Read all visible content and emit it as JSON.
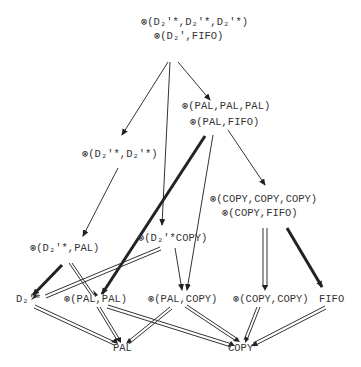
{
  "diagram": {
    "type": "lattice",
    "nodes": [
      {
        "id": "top",
        "lines": [
          "⊗(D₂'*,D₂'*,D₂'*)",
          "⊗(D₂',FIFO)"
        ]
      },
      {
        "id": "d2star_d2star",
        "lines": [
          "⊗(D₂'*,D₂'*)"
        ]
      },
      {
        "id": "pal3",
        "lines": [
          "⊗(PAL,PAL,PAL)",
          "⊗(PAL,FIFO)"
        ]
      },
      {
        "id": "copy3",
        "lines": [
          "⊗(COPY,COPY,COPY)",
          "⊗(COPY,FIFO)"
        ]
      },
      {
        "id": "d2star_pal",
        "lines": [
          "⊗(D₂'*,PAL)"
        ]
      },
      {
        "id": "d2star_copy",
        "lines": [
          "⊗(D₂'*,COPY)"
        ]
      },
      {
        "id": "d2star",
        "lines": [
          "D₂'*"
        ]
      },
      {
        "id": "pal_pal",
        "lines": [
          "⊗(PAL,PAL)"
        ]
      },
      {
        "id": "pal_copy",
        "lines": [
          "⊗(PAL,COPY)"
        ]
      },
      {
        "id": "copy_copy",
        "lines": [
          "⊗(COPY,COPY)"
        ]
      },
      {
        "id": "fifo",
        "lines": [
          "FIFO"
        ]
      },
      {
        "id": "pal",
        "lines": [
          "PAL"
        ]
      },
      {
        "id": "copy",
        "lines": [
          "COPY"
        ]
      }
    ],
    "edges": [
      {
        "from": "top",
        "to": "d2star_d2star",
        "style": "single"
      },
      {
        "from": "top",
        "to": "d2star_copy",
        "style": "single"
      },
      {
        "from": "top",
        "to": "pal3",
        "style": "single"
      },
      {
        "from": "pal3",
        "to": "copy3",
        "style": "single"
      },
      {
        "from": "pal3",
        "to": "pal_pal",
        "style": "bold"
      },
      {
        "from": "pal3",
        "to": "pal_copy",
        "style": "single"
      },
      {
        "from": "d2star_d2star",
        "to": "d2star_pal",
        "style": "single"
      },
      {
        "from": "d2star_pal",
        "to": "d2star",
        "style": "bold"
      },
      {
        "from": "d2star_pal",
        "to": "pal_pal",
        "style": "double"
      },
      {
        "from": "d2star_copy",
        "to": "d2star",
        "style": "double"
      },
      {
        "from": "d2star_copy",
        "to": "pal_copy",
        "style": "single"
      },
      {
        "from": "copy3",
        "to": "copy_copy",
        "style": "double"
      },
      {
        "from": "copy3",
        "to": "fifo",
        "style": "bold"
      },
      {
        "from": "d2star",
        "to": "pal",
        "style": "double"
      },
      {
        "from": "pal_pal",
        "to": "pal",
        "style": "double"
      },
      {
        "from": "pal_pal",
        "to": "copy",
        "style": "double"
      },
      {
        "from": "pal_copy",
        "to": "pal",
        "style": "double"
      },
      {
        "from": "pal_copy",
        "to": "copy",
        "style": "double"
      },
      {
        "from": "copy_copy",
        "to": "copy",
        "style": "double"
      },
      {
        "from": "fifo",
        "to": "copy",
        "style": "double"
      }
    ]
  },
  "labels": {
    "top_l1": "⊗(D₂'*,D₂'*,D₂'*)",
    "top_l2": "⊗(D₂',FIFO)",
    "d2d2": "⊗(D₂'*,D₂'*)",
    "pal3_l1": "⊗(PAL,PAL,PAL)",
    "pal3_l2": "⊗(PAL,FIFO)",
    "copy3_l1": "⊗(COPY,COPY,COPY)",
    "copy3_l2": "⊗(COPY,FIFO)",
    "d2pal": "⊗(D₂'*,PAL)",
    "d2copy": "⊗(D₂'*COPY)",
    "d2": "D₂'*",
    "palpal": "⊗(PAL,PAL)",
    "palcopy": "⊗(PAL,COPY)",
    "copycopy": "⊗(COPY,COPY)",
    "fifo": "FIFO",
    "pal": "PAL",
    "copy": "COPY"
  }
}
